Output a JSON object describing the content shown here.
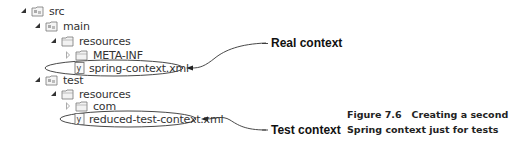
{
  "tree": {
    "items": [
      {
        "label": "src",
        "icon": "source-folder-icon",
        "expanded": true
      },
      {
        "label": "main",
        "icon": "source-folder-icon",
        "expanded": true
      },
      {
        "label": "resources",
        "icon": "folder-icon",
        "expanded": true
      },
      {
        "label": "META-INF",
        "icon": "folder-icon",
        "expanded": false
      },
      {
        "label": "spring-context.xml",
        "icon": "xml-file-icon"
      },
      {
        "label": "test",
        "icon": "source-folder-icon",
        "expanded": true
      },
      {
        "label": "resources",
        "icon": "folder-icon",
        "expanded": true
      },
      {
        "label": "com",
        "icon": "folder-icon",
        "expanded": false
      },
      {
        "label": "reduced-test-context.xml",
        "icon": "xml-file-icon"
      }
    ]
  },
  "callouts": {
    "real": "Real context",
    "test": "Test context"
  },
  "caption": {
    "line1": "Figure 7.6   Creating a second",
    "line2": "Spring context just for tests"
  }
}
